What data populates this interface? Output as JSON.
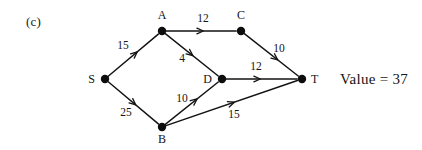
{
  "figure": {
    "panel_label": "(c)",
    "value_text": "Value = 37",
    "ink_color": "#131313",
    "background_color": "#ffffff"
  },
  "chart_data": {
    "type": "diagram",
    "title": "(c)",
    "annotations": [
      "Value = 37"
    ],
    "diagram_kind": "directed-flow-network",
    "nodes": [
      {
        "id": "S",
        "label": "S",
        "x": 105,
        "y": 79,
        "label_x": 95,
        "label_y": 83,
        "label_anchor": "end"
      },
      {
        "id": "A",
        "label": "A",
        "x": 162,
        "y": 31,
        "label_x": 162,
        "label_y": 19,
        "label_anchor": "middle"
      },
      {
        "id": "C",
        "label": "C",
        "x": 241,
        "y": 31,
        "label_x": 241,
        "label_y": 19,
        "label_anchor": "middle"
      },
      {
        "id": "D",
        "label": "D",
        "x": 222,
        "y": 79,
        "label_x": 212,
        "label_y": 83,
        "label_anchor": "end"
      },
      {
        "id": "B",
        "label": "B",
        "x": 162,
        "y": 127,
        "label_x": 162,
        "label_y": 143,
        "label_anchor": "middle"
      },
      {
        "id": "T",
        "label": "T",
        "x": 302,
        "y": 79,
        "label_x": 311,
        "label_y": 83,
        "label_anchor": "start"
      }
    ],
    "edges": [
      {
        "from": "S",
        "to": "A",
        "weight": "15",
        "label_x": 123,
        "label_y": 49,
        "arrow_t": 0.58
      },
      {
        "from": "S",
        "to": "B",
        "weight": "25",
        "label_x": 126,
        "label_y": 116,
        "arrow_t": 0.55
      },
      {
        "from": "A",
        "to": "C",
        "weight": "12",
        "label_x": 203,
        "label_y": 22,
        "arrow_t": 0.53
      },
      {
        "from": "A",
        "to": "D",
        "weight": "4",
        "label_x": 182,
        "label_y": 62,
        "arrow_t": 0.52
      },
      {
        "from": "C",
        "to": "T",
        "weight": "10",
        "label_x": 279,
        "label_y": 52,
        "arrow_t": 0.62
      },
      {
        "from": "D",
        "to": "T",
        "weight": "12",
        "label_x": 256,
        "label_y": 70,
        "arrow_t": 0.48
      },
      {
        "from": "B",
        "to": "D",
        "weight": "10",
        "label_x": 182,
        "label_y": 102,
        "arrow_t": 0.6
      },
      {
        "from": "B",
        "to": "T",
        "weight": "15",
        "label_x": 234,
        "label_y": 118,
        "arrow_t": 0.52
      }
    ]
  }
}
